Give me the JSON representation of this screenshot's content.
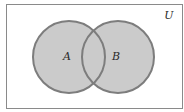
{
  "diagram": {
    "type": "venn",
    "universe_label": "U",
    "sets": [
      {
        "label": "A",
        "cx": 69,
        "cy": 57,
        "r": 36
      },
      {
        "label": "B",
        "cx": 118,
        "cy": 57,
        "r": 36
      }
    ],
    "shaded": "A ∪ B",
    "colors": {
      "background": "#ffffff",
      "frame": "#8a8a8a",
      "fill": "#cbcbcb",
      "stroke": "#7d7d7d",
      "text": "#2a2a2a"
    }
  }
}
